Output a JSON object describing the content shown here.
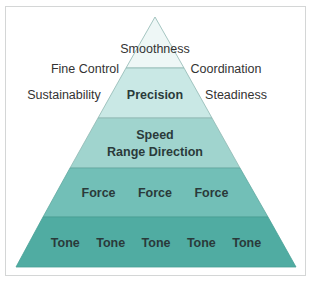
{
  "diagram": {
    "type": "pyramid",
    "tiers": [
      {
        "label": "Smoothness",
        "color": "#eef7f6"
      },
      {
        "label": "Precision",
        "color": "#c9e8e5"
      },
      {
        "label_lines": [
          "Speed",
          "Range Direction"
        ],
        "color": "#a0d4ce"
      },
      {
        "label": "Force   Force   Force",
        "items": [
          "Force",
          "Force",
          "Force"
        ],
        "color": "#72bfb7"
      },
      {
        "label": "Tone   Tone   Tone   Tone   Tone",
        "items": [
          "Tone",
          "Tone",
          "Tone",
          "Tone",
          "Tone"
        ],
        "color": "#50aca2"
      }
    ],
    "side_labels": {
      "left": [
        "Fine Control",
        "Sustainability"
      ],
      "right": [
        "Coordination",
        "Steadiness"
      ]
    },
    "edge_color": "#8fb8b3",
    "border_color": "#d4d6d6"
  }
}
